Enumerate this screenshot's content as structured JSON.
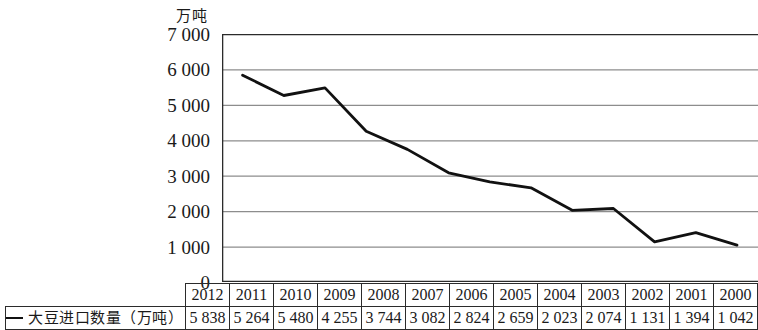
{
  "chart_data": {
    "type": "line",
    "title": "",
    "unit_label": "万吨",
    "ylabel": "万吨",
    "xlabel": "",
    "series_name": "大豆进口数量（万吨）",
    "legend_position": "bottom-left",
    "grid": true,
    "ylim": [
      0,
      7000
    ],
    "yticks": [
      7000,
      6000,
      5000,
      4000,
      3000,
      2000,
      1000,
      0
    ],
    "ytick_labels": [
      "7 000",
      "6 000",
      "5 000",
      "4 000",
      "3 000",
      "2 000",
      "1 000",
      "0"
    ],
    "categories": [
      "2012",
      "2011",
      "2010",
      "2009",
      "2008",
      "2007",
      "2006",
      "2005",
      "2004",
      "2003",
      "2002",
      "2001",
      "2000"
    ],
    "values": [
      5838,
      5264,
      5480,
      4255,
      3744,
      3082,
      2824,
      2659,
      2023,
      2074,
      1131,
      1394,
      1042
    ],
    "value_labels": [
      "5 838",
      "5 264",
      "5 480",
      "4 255",
      "3 744",
      "3 082",
      "2 824",
      "2 659",
      "2 023",
      "2 074",
      "1 131",
      "1 394",
      "1 042"
    ],
    "line_color": "#111111",
    "grid_color": "#8d8d8d",
    "axis_color": "#2b2b2b"
  },
  "legend": {
    "label": "大豆进口数量（万吨）",
    "swatch": "line-swatch"
  }
}
